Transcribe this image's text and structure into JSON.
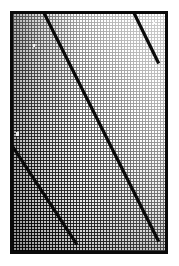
{
  "figure": {
    "title": "",
    "caption": "",
    "background_color": "#ffffff",
    "ink_color": "#0a0a0a"
  },
  "frame": {
    "name": "plot-frame",
    "x": 10,
    "y": 11,
    "width": 158,
    "height": 243,
    "border_width": 3,
    "border_color": "#0a0a0a"
  },
  "chart_data": {
    "type": "line",
    "title": "",
    "subtitle": "",
    "xlabel": "",
    "ylabel": "",
    "xlim": [
      0,
      158
    ],
    "ylim": [
      0,
      243
    ],
    "grid": true,
    "grid_style": "crosshatch-halftone",
    "legend": null,
    "legend_position": "none",
    "tick_labels_x": [],
    "tick_labels_y": [],
    "annotations": [],
    "shading": {
      "type": "tonal-gradient",
      "description": "dense halftone crosshatch, dark at lower-left, lightening toward upper-right",
      "dark_value": "#1a1a1a",
      "light_value": "#ededed",
      "gradient_angle_deg": 55
    },
    "series": [
      {
        "name": "line-1-upper-short",
        "color": "#0a0a0a",
        "width": 3,
        "points": [
          [
            133,
            11
          ],
          [
            158,
            62
          ]
        ]
      },
      {
        "name": "line-2-main-long",
        "color": "#0a0a0a",
        "width": 3,
        "points": [
          [
            43,
            11
          ],
          [
            158,
            240
          ]
        ]
      },
      {
        "name": "line-3-lower-left",
        "color": "#0a0a0a",
        "width": 3,
        "points": [
          [
            3,
            132
          ],
          [
            76,
            243
          ]
        ]
      }
    ]
  }
}
